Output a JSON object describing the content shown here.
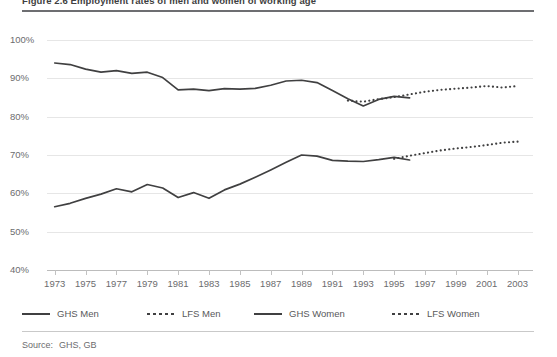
{
  "figure": {
    "title": "Figure 2.6  Employment rates of men and women of working age",
    "source_label": "Source:",
    "source_value": "GHS, GB"
  },
  "legend": {
    "position": "bottom",
    "items": [
      {
        "label": "GHS Men",
        "style": "solid",
        "color": "#404041",
        "x": 0
      },
      {
        "label": "LFS Men",
        "style": "dotted",
        "color": "#404041",
        "x": 125
      },
      {
        "label": "GHS Women",
        "style": "solid",
        "color": "#404041",
        "x": 232
      },
      {
        "label": "LFS Women",
        "style": "dotted",
        "color": "#404041",
        "x": 370
      }
    ]
  },
  "chart_data": {
    "type": "line",
    "title": "Figure 2.6  Employment rates of men and women of working age",
    "xlabel": "",
    "ylabel": "",
    "xlim": [
      1972.5,
      2004.0
    ],
    "ylim": [
      40,
      100
    ],
    "grid": true,
    "ytick_labels": [
      "100%",
      "90%",
      "80%",
      "70%",
      "60%",
      "50%",
      "40%"
    ],
    "ytick_values": [
      100,
      90,
      80,
      70,
      60,
      50,
      40
    ],
    "xtick_labels": [
      "1973",
      "1975",
      "1977",
      "1979",
      "1981",
      "1983",
      "1985",
      "1987",
      "1989",
      "1991",
      "1993",
      "1995",
      "1997",
      "1999",
      "2001",
      "2003"
    ],
    "xtick_values": [
      1973,
      1975,
      1977,
      1979,
      1981,
      1983,
      1985,
      1987,
      1989,
      1991,
      1993,
      1995,
      1997,
      1999,
      2001,
      2003
    ],
    "series": [
      {
        "name": "GHS Men",
        "style": "solid",
        "color": "#404041",
        "x": [
          1973,
          1974,
          1975,
          1976,
          1977,
          1978,
          1979,
          1980,
          1981,
          1982,
          1983,
          1984,
          1985,
          1986,
          1987,
          1988,
          1989,
          1990,
          1991,
          1992,
          1993,
          1994,
          1995,
          1996
        ],
        "values": [
          94.0,
          93.6,
          92.4,
          91.6,
          92.0,
          91.3,
          91.6,
          90.2,
          87.0,
          87.2,
          86.8,
          87.3,
          87.2,
          87.4,
          88.2,
          89.3,
          89.5,
          88.9,
          86.8,
          84.7,
          82.8,
          84.5,
          85.3,
          84.9
        ]
      },
      {
        "name": "LFS Men",
        "style": "dotted",
        "color": "#404041",
        "x": [
          1992,
          1993,
          1994,
          1995,
          1996,
          1997,
          1998,
          1999,
          2000,
          2001,
          2002,
          2003
        ],
        "values": [
          84.2,
          83.9,
          84.6,
          85.1,
          85.8,
          86.5,
          87.0,
          87.3,
          87.6,
          88.0,
          87.6,
          88.0
        ]
      },
      {
        "name": "GHS Women",
        "style": "solid",
        "color": "#404041",
        "x": [
          1973,
          1974,
          1975,
          1976,
          1977,
          1978,
          1979,
          1980,
          1981,
          1982,
          1983,
          1984,
          1985,
          1986,
          1987,
          1988,
          1989,
          1990,
          1991,
          1992,
          1993,
          1994,
          1995,
          1996
        ],
        "values": [
          56.5,
          57.4,
          58.7,
          59.8,
          61.2,
          60.4,
          62.3,
          61.4,
          58.9,
          60.2,
          58.7,
          60.9,
          62.4,
          64.2,
          66.1,
          68.1,
          70.0,
          69.7,
          68.6,
          68.4,
          68.3,
          68.8,
          69.4,
          68.7
        ]
      },
      {
        "name": "LFS Women",
        "style": "dotted",
        "color": "#404041",
        "x": [
          1995,
          1996,
          1997,
          1998,
          1999,
          2000,
          2001,
          2002,
          2003
        ],
        "values": [
          69.0,
          69.8,
          70.5,
          71.2,
          71.7,
          72.1,
          72.6,
          73.2,
          73.5
        ]
      }
    ]
  }
}
